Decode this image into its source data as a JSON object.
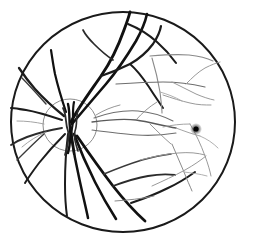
{
  "figure": {
    "background_color": "#ffffff",
    "width": 254,
    "height": 246
  },
  "globe": {
    "name": "retinal-globe-outline",
    "cx": 123,
    "cy": 122,
    "rx": 112,
    "ry": 110,
    "stroke_color": "#1a1a1a",
    "stroke_width": 2.0
  },
  "optic_disc": {
    "name": "optic-disc-outline",
    "cx": 70,
    "cy": 125,
    "rx": 27,
    "ry": 26,
    "stroke_color": "#8c8c8c",
    "stroke_width": 1.0
  },
  "macula": {
    "name": "macula-fovea-spot",
    "cx": 196,
    "cy": 129,
    "r_core": 2.6,
    "r_halo": 6.0,
    "core_color": "#000000",
    "halo_color": "#4d4d4d"
  },
  "vessel_colors": {
    "major_dark": "#111111",
    "medium_dark": "#2b2b2b",
    "medium_gray": "#5a5a5a",
    "fine_gray": "#8a8a8a",
    "faint_gray": "#a8a8a8"
  },
  "vessel_groups": [
    {
      "group": "superior-major-arcade",
      "description": "Thick dark vessels arching superiorly from the optic disc toward the upper retina",
      "vessels": [
        {
          "name": "vessel-superior-trunk-1",
          "d": "M 71 122 C 78 108 90 92 101 76 C 110 63 118 47 124 30 C 127 22 129 16 130 12",
          "width": 2.9,
          "color": "#111111"
        },
        {
          "name": "vessel-superior-trunk-2",
          "d": "M 72 124 C 82 112 94 98 106 84 C 117 71 127 56 136 41 C 141 32 145 23 147 14",
          "width": 2.6,
          "color": "#111111"
        },
        {
          "name": "vessel-superior-branch-a",
          "d": "M 101 76 C 110 73 120 69 130 64 C 139 59 147 52 153 44 C 157 38 160 32 161 26",
          "width": 2.2,
          "color": "#1c1c1c"
        },
        {
          "name": "vessel-superior-branch-b",
          "d": "M 113 60 C 107 56 100 50 94 44 C 89 39 85 34 83 30",
          "width": 1.7,
          "color": "#2b2b2b"
        },
        {
          "name": "vessel-superior-branch-c",
          "d": "M 130 64 C 137 70 143 78 149 87 C 154 95 159 102 163 108",
          "width": 2.0,
          "color": "#1c1c1c"
        },
        {
          "name": "vessel-superior-arc-top",
          "d": "M 128 24 C 138 28 148 34 157 42 C 165 49 171 56 176 63",
          "width": 2.1,
          "color": "#1c1c1c"
        }
      ]
    },
    {
      "group": "temporal-superior-fine",
      "description": "Thin gray branches spreading into the upper temporal quadrant",
      "vessels": [
        {
          "name": "vessel-temporal-sup-1",
          "d": "M 150 56 C 162 55 176 54 189 55 C 199 56 207 58 213 61",
          "width": 1.1,
          "color": "#8a8a8a"
        },
        {
          "name": "vessel-temporal-sup-2",
          "d": "M 152 58 C 155 68 158 80 160 92 C 161 101 162 108 162 113",
          "width": 1.1,
          "color": "#8a8a8a"
        },
        {
          "name": "vessel-temporal-sup-3",
          "d": "M 116 84 C 131 83 147 82 163 82 C 178 82 192 84 205 87",
          "width": 1.2,
          "color": "#6e6e6e"
        },
        {
          "name": "vessel-temporal-sup-4",
          "d": "M 172 82 C 180 86 188 90 196 94 C 203 97 209 99 214 100",
          "width": 1.0,
          "color": "#9a9a9a"
        },
        {
          "name": "vessel-temporal-sup-5",
          "d": "M 186 84 C 192 78 198 72 205 68 C 211 65 216 63 220 62",
          "width": 1.0,
          "color": "#9a9a9a"
        },
        {
          "name": "vessel-temporal-sup-6",
          "d": "M 163 95 C 172 98 181 101 190 103 C 198 105 205 105 211 105",
          "width": 1.0,
          "color": "#9a9a9a"
        },
        {
          "name": "vessel-temporal-sup-7",
          "d": "M 160 92 C 167 94 175 97 182 101",
          "width": 0.9,
          "color": "#a8a8a8"
        }
      ]
    },
    {
      "group": "papillomacular-bundle",
      "description": "Fine horizontal vessels running from the disc toward the macula",
      "vessels": [
        {
          "name": "vessel-macular-main",
          "d": "M 92 122 C 106 120 121 118 136 120 C 150 122 163 126 176 128",
          "width": 1.3,
          "color": "#5a5a5a"
        },
        {
          "name": "vessel-macular-upper",
          "d": "M 94 118 C 108 113 123 110 138 111 C 151 112 163 116 173 121",
          "width": 1.1,
          "color": "#6e6e6e"
        },
        {
          "name": "vessel-macular-lower",
          "d": "M 92 130 C 107 132 122 134 137 135 C 151 136 164 135 176 133",
          "width": 1.1,
          "color": "#6e6e6e"
        },
        {
          "name": "vessel-macular-branch-1",
          "d": "M 136 120 C 142 113 149 107 157 102",
          "width": 0.9,
          "color": "#8a8a8a"
        },
        {
          "name": "vessel-macular-branch-2",
          "d": "M 150 124 C 157 131 164 138 171 144",
          "width": 0.9,
          "color": "#8a8a8a"
        },
        {
          "name": "vessel-macular-branch-3",
          "d": "M 163 127 C 172 125 181 124 190 124",
          "width": 0.9,
          "color": "#9a9a9a"
        },
        {
          "name": "vessel-macular-branch-4",
          "d": "M 176 128 C 184 131 192 134 200 136",
          "width": 0.9,
          "color": "#9a9a9a"
        },
        {
          "name": "vessel-macular-branch-5",
          "d": "M 96 115 C 104 110 112 107 120 105",
          "width": 0.9,
          "color": "#8a8a8a"
        }
      ]
    },
    {
      "group": "nasal-radiating",
      "description": "Dark vessels radiating nasally (left) from the optic disc to the periphery",
      "vessels": [
        {
          "name": "vessel-nasal-1",
          "d": "M 64 116 C 54 108 44 99 35 89 C 28 81 23 74 19 68",
          "width": 2.3,
          "color": "#1c1c1c"
        },
        {
          "name": "vessel-nasal-2",
          "d": "M 62 120 C 50 116 38 112 26 110 C 19 109 14 108 11 108",
          "width": 2.1,
          "color": "#1c1c1c"
        },
        {
          "name": "vessel-nasal-3",
          "d": "M 62 128 C 50 130 38 133 27 137 C 19 140 14 143 11 145",
          "width": 1.9,
          "color": "#2b2b2b"
        },
        {
          "name": "vessel-nasal-4",
          "d": "M 65 134 C 56 143 47 153 39 163 C 33 171 28 178 25 183",
          "width": 2.0,
          "color": "#1c1c1c"
        },
        {
          "name": "vessel-nasal-5",
          "d": "M 66 112 C 62 100 58 87 55 74 C 53 64 52 56 51 50",
          "width": 2.2,
          "color": "#111111"
        },
        {
          "name": "vessel-nasal-fine-1",
          "d": "M 44 124 C 35 122 26 121 17 121",
          "width": 0.9,
          "color": "#9a9a9a"
        },
        {
          "name": "vessel-nasal-fine-2",
          "d": "M 46 132 C 37 136 29 141 22 147",
          "width": 0.9,
          "color": "#9a9a9a"
        },
        {
          "name": "vessel-nasal-cross",
          "d": "M 22 78 C 30 86 38 95 46 104",
          "width": 1.4,
          "color": "#3a3a3a"
        },
        {
          "name": "vessel-nasal-cross-2",
          "d": "M 17 160 C 26 151 35 142 44 134",
          "width": 1.4,
          "color": "#3a3a3a"
        }
      ]
    },
    {
      "group": "inferior-major-arcade",
      "description": "Thick dark vessels descending inferiorly from the disc toward the lower retina",
      "vessels": [
        {
          "name": "vessel-inferior-trunk-1",
          "d": "M 71 132 C 73 148 76 165 80 182 C 83 196 86 208 88 218",
          "width": 2.5,
          "color": "#111111"
        },
        {
          "name": "vessel-inferior-trunk-2",
          "d": "M 74 134 C 80 150 87 166 95 182 C 102 196 109 208 116 219",
          "width": 2.6,
          "color": "#111111"
        },
        {
          "name": "vessel-inferior-trunk-3",
          "d": "M 77 136 C 88 152 100 169 113 186 C 124 200 135 212 145 221",
          "width": 2.8,
          "color": "#111111"
        },
        {
          "name": "vessel-inferior-trunk-4",
          "d": "M 68 134 C 66 150 65 167 65 184 C 65 198 66 209 67 216",
          "width": 2.0,
          "color": "#1c1c1c"
        },
        {
          "name": "vessel-inferior-branch-a",
          "d": "M 113 186 C 124 182 136 178 148 176 C 159 174 168 174 175 175",
          "width": 1.8,
          "color": "#2b2b2b"
        },
        {
          "name": "vessel-inferior-branch-b",
          "d": "M 131 203 C 143 199 156 194 168 188 C 179 183 188 177 195 172",
          "width": 2.0,
          "color": "#1c1c1c"
        },
        {
          "name": "vessel-inferior-branch-c",
          "d": "M 104 174 C 116 169 129 164 142 160 C 153 157 163 155 171 154",
          "width": 1.5,
          "color": "#3a3a3a"
        }
      ]
    },
    {
      "group": "temporal-inferior-fine",
      "description": "Thin gray branches spreading into the lower temporal quadrant",
      "vessels": [
        {
          "name": "vessel-temporal-inf-1",
          "d": "M 140 160 C 152 157 165 154 178 153 C 189 152 198 153 205 155",
          "width": 1.0,
          "color": "#9a9a9a"
        },
        {
          "name": "vessel-temporal-inf-2",
          "d": "M 172 144 C 176 153 180 163 184 172 C 187 180 190 186 192 191",
          "width": 1.0,
          "color": "#8a8a8a"
        },
        {
          "name": "vessel-temporal-inf-3",
          "d": "M 152 186 C 163 181 174 176 185 170 C 194 165 201 160 206 156",
          "width": 1.0,
          "color": "#9a9a9a"
        },
        {
          "name": "vessel-temporal-inf-4",
          "d": "M 190 124 C 196 134 201 145 205 156 C 208 164 210 171 211 176",
          "width": 1.0,
          "color": "#9a9a9a"
        },
        {
          "name": "vessel-temporal-inf-5",
          "d": "M 200 136 C 207 139 213 143 218 148",
          "width": 0.9,
          "color": "#a8a8a8"
        },
        {
          "name": "vessel-temporal-inf-6",
          "d": "M 184 172 C 192 173 200 174 207 176",
          "width": 0.9,
          "color": "#a8a8a8"
        },
        {
          "name": "vessel-temporal-inf-7",
          "d": "M 115 201 C 128 200 141 199 154 196",
          "width": 1.0,
          "color": "#8a8a8a"
        }
      ]
    },
    {
      "group": "disc-convergence",
      "description": "Tightly bundled vessel trunks crossing at the optic disc head",
      "vessels": [
        {
          "name": "vessel-disc-bundle-1",
          "d": "M 68 104 C 70 112 69 120 70 128 C 71 137 70 145 68 153",
          "width": 2.4,
          "color": "#111111"
        },
        {
          "name": "vessel-disc-bundle-2",
          "d": "M 74 102 C 72 111 74 119 72 128 C 70 137 73 146 74 154",
          "width": 2.2,
          "color": "#111111"
        },
        {
          "name": "vessel-disc-bundle-3",
          "d": "M 63 108 C 67 116 65 123 68 131 C 70 139 67 147 65 155",
          "width": 1.8,
          "color": "#2b2b2b"
        },
        {
          "name": "vessel-disc-bundle-4",
          "d": "M 79 108 C 75 116 78 123 75 131 C 73 138 76 145 78 151",
          "width": 1.6,
          "color": "#2b2b2b"
        }
      ]
    }
  ]
}
